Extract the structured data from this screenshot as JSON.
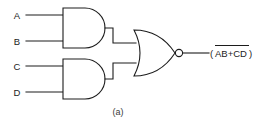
{
  "figure": {
    "caption": "(a)"
  },
  "colors": {
    "line": "#1c1c1c",
    "background": "#ffffff",
    "caption": "#3a3a3a"
  },
  "inputs": [
    {
      "label": "A",
      "gate": "and-gate-1"
    },
    {
      "label": "B",
      "gate": "and-gate-1"
    },
    {
      "label": "C",
      "gate": "and-gate-2"
    },
    {
      "label": "D",
      "gate": "and-gate-2"
    }
  ],
  "gates": [
    {
      "id": "and-gate-1",
      "type": "AND",
      "inputs": [
        "A",
        "B"
      ],
      "output": "AB"
    },
    {
      "id": "and-gate-2",
      "type": "AND",
      "inputs": [
        "C",
        "D"
      ],
      "output": "CD"
    },
    {
      "id": "nor-gate-1",
      "type": "NOR",
      "inputs": [
        "AB",
        "CD"
      ],
      "output": "(AB+CD)"
    }
  ],
  "output": {
    "open_paren": "(",
    "expression": "AB+CD",
    "close_paren": ")",
    "overbar": true,
    "full_text": "(AB+CD)"
  }
}
